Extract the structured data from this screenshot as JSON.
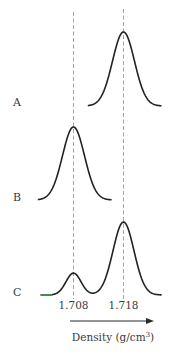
{
  "chart_data": {
    "type": "line",
    "title": "",
    "xlabel": "Density (g/cm³)",
    "xlabel_base": "Density (g/cm",
    "xlabel_sup": "3",
    "xlabel_close": ")",
    "ylabel": "",
    "x_range": [
      1.6995,
      1.7265
    ],
    "reference_lines": [
      1.708,
      1.718
    ],
    "tick_labels": [
      "1.708",
      "1.718"
    ],
    "grid": false,
    "legend": "none",
    "baseline_color": "#3a9a4a",
    "series": [
      {
        "name": "A",
        "peaks": [
          {
            "center": 1.718,
            "relative_height": 1.0,
            "width_sd": 0.0022
          }
        ],
        "x_extent": [
          1.711,
          1.7255
        ]
      },
      {
        "name": "B",
        "peaks": [
          {
            "center": 1.708,
            "relative_height": 1.0,
            "width_sd": 0.0022
          }
        ],
        "x_extent": [
          1.701,
          1.7155
        ]
      },
      {
        "name": "C",
        "peaks": [
          {
            "center": 1.708,
            "relative_height": 0.3,
            "width_sd": 0.0015
          },
          {
            "center": 1.718,
            "relative_height": 1.0,
            "width_sd": 0.0021
          }
        ],
        "x_extent": [
          1.7015,
          1.7255
        ]
      }
    ]
  }
}
